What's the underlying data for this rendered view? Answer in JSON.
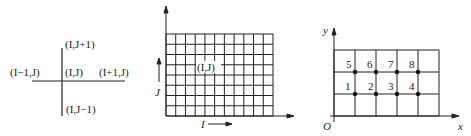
{
  "stencil": {
    "top": "(I,J+1)",
    "left": "(I−1,J)",
    "center": "(I,J)",
    "right": "(I+1,J)",
    "bottom": "(I,J−1)"
  },
  "grid": {
    "columns": 11,
    "rows": 8,
    "cell_label": "(I,J)",
    "x_axis_label": "I",
    "y_axis_label": "J"
  },
  "numbered_grid": {
    "columns": 5,
    "rows": 3,
    "x_axis_label": "x",
    "y_axis_label": "y",
    "origin_label": "O",
    "node_labels_top": [
      "5",
      "6",
      "7",
      "8"
    ],
    "node_labels_bottom": [
      "1",
      "2",
      "3",
      "4"
    ]
  },
  "colors": {
    "line": "#222222",
    "background": "#ffffff"
  }
}
